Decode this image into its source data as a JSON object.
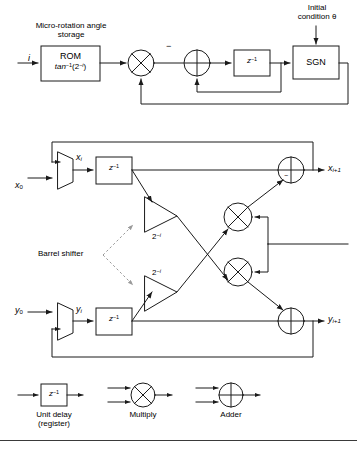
{
  "figure": {
    "title_caption": "",
    "labels": {
      "rom_caption_line1": "Micro-rotation angle",
      "rom_caption_line2": "storage",
      "rom_block_line1": "ROM",
      "rom_block_line2": "tan−1(2−i)",
      "rom_block_l2_base": "tan",
      "rom_block_l2_sup1": "−1",
      "rom_block_l2_mid": "(2",
      "rom_block_l2_sup2": "−i",
      "rom_block_l2_end": ")",
      "input_i": "i",
      "initial_condition_line1": "Initial",
      "initial_condition_line2": "condition θ",
      "sgn_block": "SGN",
      "minus_sign": "−",
      "delay_block": "z−1",
      "delay_base": "z",
      "delay_sup": "−1",
      "x0": "x0",
      "x0_base": "x",
      "x0_sub": "0",
      "xi": "xi",
      "xi_base": "x",
      "xi_sub": "i",
      "xi1_base": "x",
      "xi1_sub": "i+1",
      "y0_base": "y",
      "y0_sub": "0",
      "yi_base": "y",
      "yi_sub": "i",
      "yi1_base": "y",
      "yi1_sub": "i+1",
      "shift_base": "2",
      "shift_sup": "−i",
      "barrel_shifter": "Barrel shifter"
    },
    "legend": {
      "unit_delay_line1": "Unit delay",
      "unit_delay_line2": "(register)",
      "unit_delay_symbol_base": "z",
      "unit_delay_symbol_sup": "−1",
      "multiply": "Multiply",
      "adder": "Adder"
    },
    "icons": {
      "multiplier": "multiply-circle-icon",
      "adder": "adder-circle-icon",
      "mux": "mux-trapezoid-icon",
      "barrel_shifter": "barrel-shifter-triangle-icon",
      "arrow": "arrow-head-icon"
    },
    "colors": {
      "line": "#1a1a1a",
      "dashed_guide": "#9a9a9a",
      "background": "#ffffff",
      "rule": "#3a3a3a"
    },
    "footer_caption": ""
  }
}
